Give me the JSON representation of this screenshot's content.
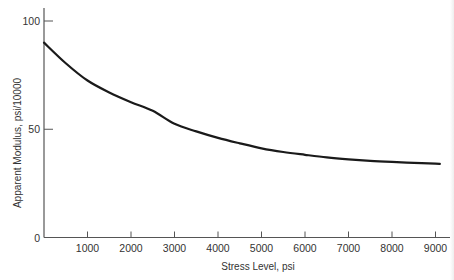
{
  "chart_data": {
    "type": "line",
    "title": "",
    "xlabel": "Stress Level, psi",
    "ylabel": "Apparent Modulus, psi/10000",
    "xlim": [
      0,
      9300
    ],
    "ylim": [
      0,
      100
    ],
    "grid": false,
    "legend": null,
    "x_ticks": [
      1000,
      2000,
      3000,
      4000,
      5000,
      6000,
      7000,
      8000,
      9000
    ],
    "x_tick_labels": [
      "1000",
      "2000",
      "3000",
      "4000",
      "5000",
      "6000",
      "7000",
      "8000",
      "9000"
    ],
    "y_ticks": [
      0,
      50,
      100
    ],
    "y_tick_labels": [
      "0",
      "50",
      "100"
    ],
    "series": [
      {
        "name": "Apparent Modulus",
        "color": "#1a1a1a",
        "x": [
          0,
          500,
          1000,
          1500,
          2000,
          2500,
          3000,
          3500,
          4000,
          4500,
          5000,
          5500,
          6000,
          6500,
          7000,
          7500,
          8000,
          8500,
          9000,
          9100
        ],
        "values": [
          90,
          80.5,
          72.5,
          67,
          62.5,
          58.5,
          52.5,
          49,
          46,
          43.5,
          41.2,
          39.5,
          38.2,
          37,
          36.1,
          35.4,
          34.9,
          34.5,
          34.1,
          34
        ]
      }
    ]
  }
}
